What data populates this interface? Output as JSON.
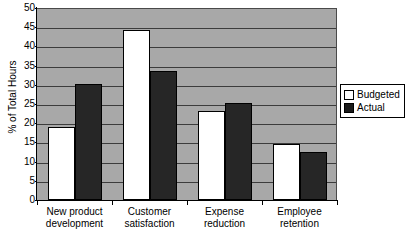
{
  "chart_data": {
    "type": "bar",
    "title": "",
    "xlabel": "",
    "ylabel": "% of Total Hours",
    "ylim": [
      0,
      50
    ],
    "yticks": [
      0,
      5,
      10,
      15,
      20,
      25,
      30,
      35,
      40,
      45,
      50
    ],
    "grid": true,
    "legend_position": "right",
    "categories": [
      "New product development",
      "Customer satisfaction",
      "Expense reduction",
      "Employee retention"
    ],
    "category_lines": [
      [
        "New product",
        "development"
      ],
      [
        "Customer",
        "satisfaction"
      ],
      [
        "Expense",
        "reduction"
      ],
      [
        "Employee",
        "retention"
      ]
    ],
    "series": [
      {
        "name": "Budgeted",
        "color": "#ffffff",
        "values": [
          19.0,
          44.2,
          23.2,
          14.6
        ]
      },
      {
        "name": "Actual",
        "color": "#262626",
        "values": [
          30.3,
          33.5,
          25.3,
          12.6
        ]
      }
    ]
  },
  "legend": {
    "items": [
      {
        "label": "Budgeted",
        "swatch": "budgeted"
      },
      {
        "label": "Actual",
        "swatch": "actual"
      }
    ]
  },
  "colors": {
    "plot_background": "#a8a8a8",
    "gridline": "#3c3c3c",
    "axis": "#000000",
    "budgeted": "#ffffff",
    "actual": "#262626",
    "page_background": "#ffffff"
  }
}
